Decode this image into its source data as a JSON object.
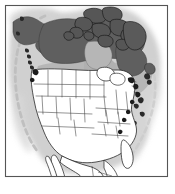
{
  "figure": {
    "type": "distribution-range-map",
    "region": "North America",
    "frame": {
      "x": 5,
      "y": 5,
      "width": 163,
      "height": 172,
      "stroke": "#555555",
      "stroke_width": 1.2,
      "fill": "#ffffff"
    },
    "canvas": {
      "width": 175,
      "height": 194,
      "background": "#ffffff"
    }
  },
  "colors": {
    "background": "#ffffff",
    "frame_border": "#555555",
    "range_dark": "#5e5e5e",
    "range_mid": "#7a7a7a",
    "water_light_gray": "#b3b3b3",
    "land_white": "#ffffff",
    "coast_outline": "#1a1a1a",
    "state_border": "#3a3a3a",
    "halo_glow": "#cfcfcf",
    "dashed_boundary": "#bdbdbd",
    "island_black": "#111111"
  },
  "legend": {
    "present": "shaded dark gray",
    "absent": "white",
    "water": "light gray",
    "note": "no printed legend text on figure"
  },
  "map_features": {
    "halo": {
      "name": "coastal-halo-glow",
      "description": "soft light gray diffuse outline following the continental coast",
      "fill": "#cfcfcf",
      "opacity": 0.85
    },
    "areas": [
      {
        "id": "alaska",
        "name": "Alaska",
        "fill": "range_dark",
        "shaded": true
      },
      {
        "id": "yukon-nwt",
        "name": "Yukon and Northwest Territories",
        "fill": "range_dark",
        "shaded": true
      },
      {
        "id": "nunavut-mainland",
        "name": "Nunavut mainland",
        "fill": "range_dark",
        "shaded": true
      },
      {
        "id": "arctic-archipelago",
        "name": "Canadian Arctic Archipelago",
        "fill": "range_dark",
        "shaded": true,
        "outline": "island_black"
      },
      {
        "id": "baffin-island",
        "name": "Baffin Island",
        "fill": "range_dark",
        "shaded": true
      },
      {
        "id": "quebec-labrador",
        "name": "Quebec and Labrador",
        "fill": "range_dark",
        "shaded": true
      },
      {
        "id": "hudson-bay",
        "name": "Hudson Bay",
        "fill": "water_light_gray",
        "shaded": false
      },
      {
        "id": "southern-canada",
        "name": "Southern Canada prairie belt",
        "fill": "water_light_gray",
        "shaded": false
      },
      {
        "id": "great-lakes",
        "name": "Great Lakes",
        "fill": "water_light_gray",
        "shaded": false
      },
      {
        "id": "conterminous-us",
        "name": "Conterminous United States",
        "fill": "land_white",
        "shaded": false
      },
      {
        "id": "mexico-baja",
        "name": "Mexico and Baja California",
        "fill": "land_white",
        "shaded": false,
        "clipped_at_frame": true
      }
    ],
    "dashed_lines": [
      {
        "id": "pacific-dashed-arc",
        "name": "Pacific offshore dashed boundary",
        "color": "#bdbdbd",
        "dash": "5 4",
        "width": 3
      },
      {
        "id": "atlantic-dashed-arc",
        "name": "Atlantic offshore dashed boundary",
        "color": "#c9c9c9",
        "dash": "5 4",
        "width": 3
      }
    ],
    "internal_borders": {
      "name": "state-and-province-boundaries",
      "color": "#3a3a3a",
      "width": 0.55
    }
  }
}
